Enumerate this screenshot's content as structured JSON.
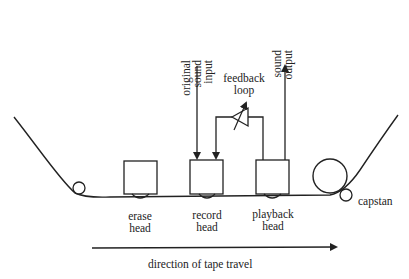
{
  "diagram": {
    "labels": {
      "original_sound_input": [
        "original",
        "sound",
        "input"
      ],
      "sound_output": [
        "sound",
        "output"
      ],
      "feedback_loop": [
        "feedback",
        "loop"
      ],
      "erase_head": [
        "erase",
        "head"
      ],
      "record_head": [
        "record",
        "head"
      ],
      "playback_head": [
        "playback",
        "head"
      ],
      "capstan": "capstan",
      "direction": "direction of tape travel"
    },
    "colors": {
      "stroke": "#222222",
      "background": "#ffffff"
    }
  }
}
